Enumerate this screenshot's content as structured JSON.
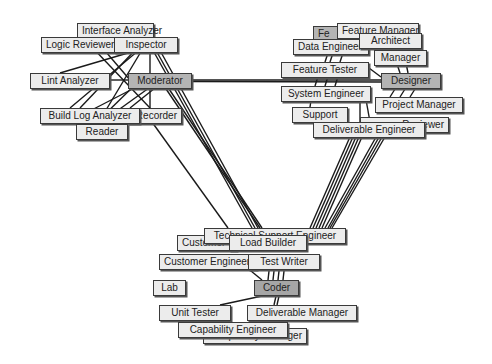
{
  "diagram": {
    "type": "network-graph",
    "hubs": [
      "Moderator",
      "Designer",
      "Coder"
    ],
    "colors": {
      "node_fill": "#ececec",
      "hub_fill": "#b4b4b4",
      "coder_fill": "#a6a6a6",
      "border": "#3a3a3a",
      "edge": "#1a1a1a",
      "background": "#ffffff"
    },
    "clusters": {
      "left": {
        "hub": "Moderator",
        "nodes": [
          {
            "id": "interface_analyzer",
            "label": "Interface Analyzer",
            "x": 77,
            "y": 23,
            "w": 76
          },
          {
            "id": "logic_reviewer",
            "label": "Logic Reviewer",
            "x": 41,
            "y": 37,
            "w": 76
          },
          {
            "id": "inspector",
            "label": "Inspector",
            "x": 114,
            "y": 37,
            "w": 64
          },
          {
            "id": "lint_analyzer",
            "label": "Lint Analyzer",
            "x": 30,
            "y": 73,
            "w": 79
          },
          {
            "id": "moderator",
            "label": "Moderator",
            "x": 128,
            "y": 73,
            "w": 64,
            "hub": true
          },
          {
            "id": "recorder",
            "label": "Recorder",
            "x": 150,
            "y": 108,
            "w": 31
          },
          {
            "id": "build_log_analyzer",
            "label": "Build Log Analyzer",
            "x": 40,
            "y": 108,
            "w": 100
          },
          {
            "id": "reader",
            "label": "Reader",
            "x": 76,
            "y": 124,
            "w": 51
          }
        ]
      },
      "right": {
        "hub": "Designer",
        "nodes": [
          {
            "id": "f_hidden",
            "label": "Fe",
            "x": 313,
            "y": 26,
            "w": 40
          },
          {
            "id": "feature_manager",
            "label": "Feature Manager",
            "x": 337,
            "y": 23,
            "w": 82
          },
          {
            "id": "data_engineer",
            "label": "Data Engineer",
            "x": 293,
            "y": 39,
            "w": 72
          },
          {
            "id": "architect",
            "label": "Architect",
            "x": 359,
            "y": 33,
            "w": 63
          },
          {
            "id": "manager",
            "label": "Manager",
            "x": 374,
            "y": 50,
            "w": 53
          },
          {
            "id": "feature_tester",
            "label": "Feature Tester",
            "x": 281,
            "y": 62,
            "w": 88
          },
          {
            "id": "designer",
            "label": "Designer",
            "x": 381,
            "y": 73,
            "w": 60,
            "hub": true
          },
          {
            "id": "system_engineer",
            "label": "System Engineer",
            "x": 281,
            "y": 86,
            "w": 90
          },
          {
            "id": "project_manager",
            "label": "Project Manager",
            "x": 375,
            "y": 97,
            "w": 87
          },
          {
            "id": "support",
            "label": "Support",
            "x": 292,
            "y": 107,
            "w": 56
          },
          {
            "id": "reviewer",
            "label": "Reviewer",
            "x": 360,
            "y": 117,
            "w": 89
          },
          {
            "id": "deliverable_engineer",
            "label": "Deliverable Engineer",
            "x": 313,
            "y": 122,
            "w": 112
          }
        ]
      },
      "bottom": {
        "hub": "Coder",
        "nodes": [
          {
            "id": "customer_x",
            "label": "Customer",
            "x": 177,
            "y": 235,
            "w": 60
          },
          {
            "id": "technical_support_engineer",
            "label": "Technical Support Engineer",
            "x": 204,
            "y": 228,
            "w": 142
          },
          {
            "id": "load_builder",
            "label": "Load Builder",
            "x": 229,
            "y": 235,
            "w": 78
          },
          {
            "id": "customer_engineer",
            "label": "Customer Engineer",
            "x": 159,
            "y": 254,
            "w": 98
          },
          {
            "id": "test_writer",
            "label": "Test Writer",
            "x": 248,
            "y": 254,
            "w": 72
          },
          {
            "id": "lab",
            "label": "Lab",
            "x": 153,
            "y": 280,
            "w": 33
          },
          {
            "id": "coder",
            "label": "Coder",
            "x": 254,
            "y": 280,
            "w": 45,
            "hub": true
          },
          {
            "id": "unit_tester",
            "label": "Unit Tester",
            "x": 159,
            "y": 305,
            "w": 72
          },
          {
            "id": "deliverable_manager",
            "label": "Deliverable Manager",
            "x": 247,
            "y": 305,
            "w": 110
          },
          {
            "id": "capability_manager",
            "label": "Capability Manager",
            "x": 203,
            "y": 328,
            "w": 104
          },
          {
            "id": "capability_engineer",
            "label": "Capability Engineer",
            "x": 178,
            "y": 322,
            "w": 110
          }
        ]
      }
    }
  }
}
